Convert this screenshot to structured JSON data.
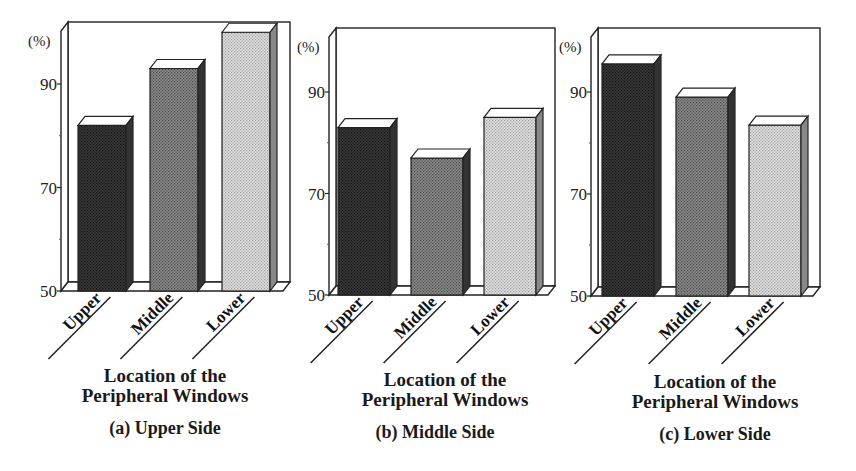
{
  "figure": {
    "panels": [
      {
        "id": "a",
        "caption": "(a) Upper Side",
        "xtitle_line1": "Location of the",
        "xtitle_line2": "Peripheral Windows",
        "y_unit": "(%)"
      },
      {
        "id": "b",
        "caption": "(b) Middle Side",
        "xtitle_line1": "Location of the",
        "xtitle_line2": "Peripheral Windows",
        "y_unit": "(%)"
      },
      {
        "id": "c",
        "caption": "(c) Lower Side",
        "xtitle_line1": "Location of the",
        "xtitle_line2": "Peripheral Windows",
        "y_unit": "(%)"
      }
    ],
    "bar_fills": {
      "Upper": "#3a3a3a",
      "Middle": "#8c8c8c",
      "Lower": "#e2e2e2"
    }
  },
  "chart_data": [
    {
      "type": "bar",
      "title": "(a) Upper Side",
      "xlabel": "Location of the Peripheral Windows",
      "ylabel": "(%)",
      "categories": [
        "Upper",
        "Middle",
        "Lower"
      ],
      "values": [
        82,
        93,
        100
      ],
      "ylim": [
        50,
        100
      ],
      "yticks": [
        50,
        70,
        90
      ],
      "grid": false,
      "style": "3d-bar"
    },
    {
      "type": "bar",
      "title": "(b) Middle Side",
      "xlabel": "Location of the Peripheral Windows",
      "ylabel": "(%)",
      "categories": [
        "Upper",
        "Middle",
        "Lower"
      ],
      "values": [
        83,
        77,
        85
      ],
      "ylim": [
        50,
        100
      ],
      "yticks": [
        50,
        70,
        90
      ],
      "grid": false,
      "style": "3d-bar"
    },
    {
      "type": "bar",
      "title": "(c) Lower Side",
      "xlabel": "Location of the Peripheral Windows",
      "ylabel": "(%)",
      "categories": [
        "Upper",
        "Middle",
        "Lower"
      ],
      "values": [
        95.5,
        89,
        83.5
      ],
      "ylim": [
        50,
        100
      ],
      "yticks": [
        50,
        70,
        90
      ],
      "grid": false,
      "style": "3d-bar"
    }
  ]
}
